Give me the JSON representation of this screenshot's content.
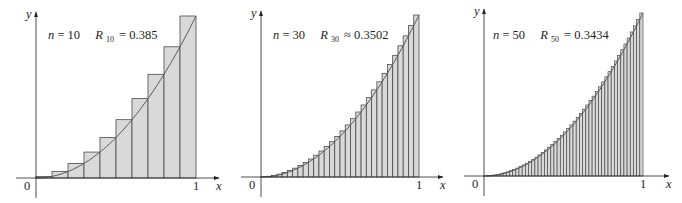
{
  "colors": {
    "bar_fill": "#d9d9d9",
    "bar_stroke": "#4a4a4a",
    "curve": "#555555",
    "axis": "#231f20",
    "background": "#ffffff"
  },
  "chart_data": [
    {
      "type": "bar",
      "title": "n = 10   R10 = 0.385",
      "n": 10,
      "label_n": "n",
      "label_n_value": "= 10",
      "label_R": "R",
      "label_R_sub": "10",
      "label_R_rel": "= 0.385",
      "R_value": 0.385,
      "function": "y = x^2",
      "method": "right endpoints",
      "xlabel": "x",
      "ylabel": "y",
      "x_ticks": [
        "0",
        "1"
      ],
      "xlim": [
        0,
        1
      ],
      "ylim": [
        0,
        1
      ],
      "grid": false,
      "categories": [
        "0.1",
        "0.2",
        "0.3",
        "0.4",
        "0.5",
        "0.6",
        "0.7",
        "0.8",
        "0.9",
        "1.0"
      ],
      "values": [
        0.01,
        0.04,
        0.09,
        0.16,
        0.25,
        0.36,
        0.49,
        0.64,
        0.81,
        1.0
      ]
    },
    {
      "type": "bar",
      "title": "n = 30   R30 ≈ 0.3502",
      "n": 30,
      "label_n": "n",
      "label_n_value": "= 30",
      "label_R": "R",
      "label_R_sub": "30",
      "label_R_rel": "≈ 0.3502",
      "R_value": 0.3502,
      "function": "y = x^2",
      "method": "right endpoints",
      "xlabel": "x",
      "ylabel": "y",
      "x_ticks": [
        "0",
        "1"
      ],
      "xlim": [
        0,
        1
      ],
      "ylim": [
        0,
        1
      ],
      "grid": false
    },
    {
      "type": "bar",
      "title": "n = 50   R50 = 0.3434",
      "n": 50,
      "label_n": "n",
      "label_n_value": "= 50",
      "label_R": "R",
      "label_R_sub": "50",
      "label_R_rel": "= 0.3434",
      "R_value": 0.3434,
      "function": "y = x^2",
      "method": "right endpoints",
      "xlabel": "x",
      "ylabel": "y",
      "x_ticks": [
        "0",
        "1"
      ],
      "xlim": [
        0,
        1
      ],
      "ylim": [
        0,
        1
      ],
      "grid": false
    }
  ],
  "panels": [
    {
      "ox": 36,
      "oy": 178,
      "x1": 196,
      "top": 16,
      "axis_end": 219,
      "y_top": 12,
      "label_x": 48,
      "label_y": 39
    },
    {
      "ox": 261,
      "oy": 177,
      "x1": 419,
      "top": 15,
      "axis_end": 443,
      "y_top": 11,
      "label_x": 273,
      "label_y": 39
    },
    {
      "ox": 484,
      "oy": 176,
      "x1": 643,
      "top": 13,
      "axis_end": 669,
      "y_top": 9,
      "label_x": 493,
      "label_y": 39
    }
  ]
}
